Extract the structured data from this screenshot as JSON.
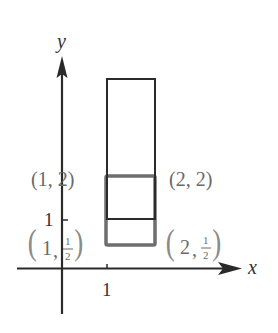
{
  "axes": {
    "x_label": "x",
    "y_label": "y",
    "x_tick_label": "1",
    "y_tick_label": "1",
    "axis_color": "#2a2a2a"
  },
  "points": {
    "top_left": {
      "text": "(1, 2)",
      "x": "1",
      "y": "2"
    },
    "top_right": {
      "text": "(2, 2)",
      "x": "2",
      "y": "2"
    },
    "bottom_left": {
      "text": "(1, 1/2)",
      "x": "1",
      "y_num": "1",
      "y_den": "2"
    },
    "bottom_right": {
      "text": "(2, 1/2)",
      "x": "2",
      "y_num": "1",
      "y_den": "2"
    }
  },
  "shapes": {
    "tall_rectangle": {
      "description": "black outline rectangle from y=1 upward",
      "color": "#2b2b2b"
    },
    "short_rectangle": {
      "description": "gray outline rectangle from (1,1/2) to (2,2)",
      "color": "#6e6e6e"
    }
  },
  "label_color": "#6a6a6a"
}
